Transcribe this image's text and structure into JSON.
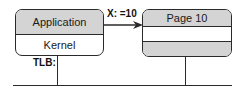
{
  "diagram": {
    "left_box": {
      "top_label": "Application",
      "bottom_label": "Kernel"
    },
    "arrow": {
      "label": "X: =10"
    },
    "right_box": {
      "top_label": "Page 10",
      "middle_label": "",
      "bottom_label": ""
    },
    "tlb_label": "TLB:",
    "colors": {
      "section_fill": "#d4d4d4",
      "stroke": "#2a2a2a",
      "background": "#ffffff"
    }
  }
}
